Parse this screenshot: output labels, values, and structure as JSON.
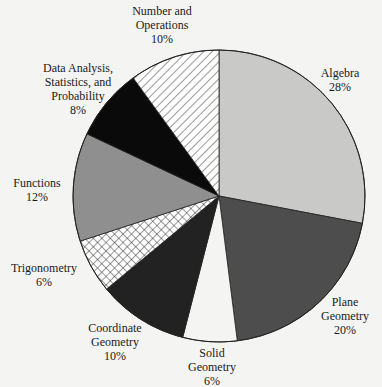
{
  "chart_data": {
    "type": "pie",
    "title": "",
    "start_angle_deg": 0,
    "direction": "clockwise",
    "slices": [
      {
        "label": "Algebra",
        "value": 28,
        "pct_label": "28%",
        "fill": "#c9c9c7",
        "pattern": "solid"
      },
      {
        "label": "Plane Geometry",
        "value": 20,
        "pct_label": "20%",
        "fill": "#4d4d4d",
        "pattern": "solid"
      },
      {
        "label": "Solid Geometry",
        "value": 6,
        "pct_label": "6%",
        "fill": "#f4f4f2",
        "pattern": "solid"
      },
      {
        "label": "Coordinate Geometry",
        "value": 10,
        "pct_label": "10%",
        "fill": "#222222",
        "pattern": "solid"
      },
      {
        "label": "Trigonometry",
        "value": 6,
        "pct_label": "6%",
        "fill": "#ffffff",
        "pattern": "crosshatch"
      },
      {
        "label": "Functions",
        "value": 12,
        "pct_label": "12%",
        "fill": "#8f8f8f",
        "pattern": "solid"
      },
      {
        "label": "Data Analysis, Statistics, and Probability",
        "value": 8,
        "pct_label": "8%",
        "fill": "#0a0a0a",
        "pattern": "solid"
      },
      {
        "label": "Number and Operations",
        "value": 10,
        "pct_label": "10%",
        "fill": "#ffffff",
        "pattern": "diagonal"
      }
    ]
  },
  "labels": {
    "algebra": {
      "lines": [
        "Algebra"
      ],
      "pct": "28%"
    },
    "plane": {
      "lines": [
        "Plane",
        "Geometry"
      ],
      "pct": "20%"
    },
    "solid": {
      "lines": [
        "Solid",
        "Geometry"
      ],
      "pct": "6%"
    },
    "coordinate": {
      "lines": [
        "Coordinate",
        "Geometry"
      ],
      "pct": "10%"
    },
    "trig": {
      "lines": [
        "Trigonometry"
      ],
      "pct": "6%"
    },
    "functions": {
      "lines": [
        "Functions"
      ],
      "pct": "12%"
    },
    "data": {
      "lines": [
        "Data Analysis,",
        "Statistics, and",
        "Probability"
      ],
      "pct": "8%"
    },
    "number": {
      "lines": [
        "Number and",
        "Operations"
      ],
      "pct": "10%"
    }
  }
}
